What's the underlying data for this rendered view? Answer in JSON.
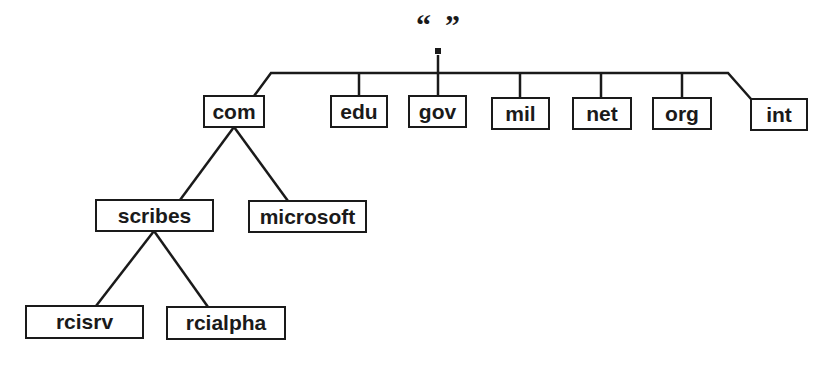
{
  "root": {
    "label": "“”",
    "dot": "."
  },
  "nodes": {
    "com": "com",
    "edu": "edu",
    "gov": "gov",
    "mil": "mil",
    "net": "net",
    "org": "org",
    "int": "int",
    "scribes": "scribes",
    "microsoft": "microsoft",
    "rcisrv": "rcisrv",
    "rcialpha": "rcialpha"
  },
  "edges": [
    [
      "root",
      "com"
    ],
    [
      "root",
      "edu"
    ],
    [
      "root",
      "gov"
    ],
    [
      "root",
      "mil"
    ],
    [
      "root",
      "net"
    ],
    [
      "root",
      "org"
    ],
    [
      "root",
      "int"
    ],
    [
      "com",
      "scribes"
    ],
    [
      "com",
      "microsoft"
    ],
    [
      "scribes",
      "rcisrv"
    ],
    [
      "scribes",
      "rcialpha"
    ]
  ],
  "colors": {
    "stroke": "#1a1a1a",
    "background": "#ffffff"
  }
}
